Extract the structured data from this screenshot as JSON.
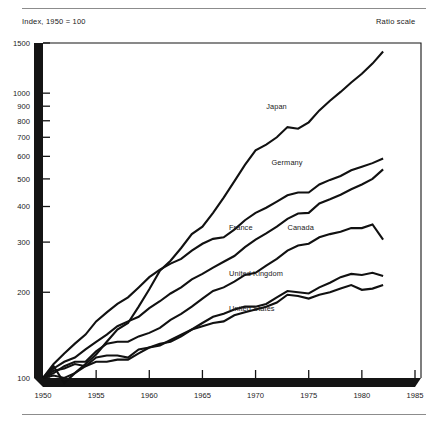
{
  "notes": {
    "index_note": "Index, 1950 = 100",
    "ratio_note": "Ratio scale"
  },
  "chart_data": {
    "type": "line",
    "title": "",
    "subtitle": "",
    "xlabel": "",
    "ylabel": "Index, 1950 = 100",
    "scale": "log",
    "grid": false,
    "legend_position": "inline-labels",
    "xlim": [
      1950,
      1985
    ],
    "ylim": [
      90,
      1600
    ],
    "x_ticks": [
      1950,
      1955,
      1960,
      1965,
      1970,
      1975,
      1980,
      1985
    ],
    "x_tick_labels": [
      "1950",
      "1955",
      "1960",
      "1965",
      "1970",
      "1975",
      "1980",
      "1985"
    ],
    "y_ticks": [
      100,
      200,
      300,
      400,
      500,
      600,
      700,
      800,
      900,
      1000,
      1500
    ],
    "y_tick_labels": [
      "100",
      "200",
      "300",
      "400",
      "500",
      "600",
      "700",
      "800",
      "900",
      "1000",
      "1500"
    ],
    "line_color": "#111111",
    "series": [
      {
        "name": "Japan",
        "label": "Japan",
        "label_x": 1971.0,
        "label_y": 880,
        "x": [
          1950,
          1951,
          1952,
          1953,
          1954,
          1955,
          1956,
          1957,
          1958,
          1959,
          1960,
          1961,
          1962,
          1963,
          1964,
          1965,
          1966,
          1967,
          1968,
          1969,
          1970,
          1971,
          1972,
          1973,
          1974,
          1975,
          1976,
          1977,
          1978,
          1979,
          1980,
          1981,
          1982
        ],
        "y": [
          100,
          110,
          96,
          104,
          112,
          121,
          134,
          148,
          156,
          178,
          205,
          238,
          258,
          286,
          320,
          340,
          380,
          430,
          490,
          560,
          630,
          660,
          700,
          760,
          750,
          790,
          870,
          940,
          1010,
          1090,
          1170,
          1270,
          1400
        ]
      },
      {
        "name": "Germany",
        "label": "Germany",
        "label_x": 1971.5,
        "label_y": 560,
        "x": [
          1950,
          1951,
          1952,
          1953,
          1954,
          1955,
          1956,
          1957,
          1958,
          1959,
          1960,
          1961,
          1962,
          1963,
          1964,
          1965,
          1966,
          1967,
          1968,
          1969,
          1970,
          1971,
          1972,
          1973,
          1974,
          1975,
          1976,
          1977,
          1978,
          1979,
          1980,
          1981,
          1982
        ],
        "y": [
          100,
          112,
          122,
          132,
          142,
          158,
          170,
          182,
          192,
          208,
          226,
          240,
          252,
          262,
          280,
          296,
          308,
          312,
          332,
          358,
          380,
          396,
          416,
          438,
          448,
          448,
          478,
          496,
          512,
          536,
          552,
          568,
          590
        ]
      },
      {
        "name": "France",
        "label": "France",
        "label_x": 1967.5,
        "label_y": 330,
        "x": [
          1950,
          1951,
          1952,
          1953,
          1954,
          1955,
          1956,
          1957,
          1958,
          1959,
          1960,
          1961,
          1962,
          1963,
          1964,
          1965,
          1966,
          1967,
          1968,
          1969,
          1970,
          1971,
          1972,
          1973,
          1974,
          1975,
          1976,
          1977,
          1978,
          1979,
          1980,
          1981,
          1982
        ],
        "y": [
          100,
          108,
          114,
          118,
          126,
          134,
          142,
          152,
          158,
          164,
          176,
          186,
          198,
          208,
          222,
          232,
          244,
          256,
          268,
          288,
          306,
          322,
          340,
          362,
          378,
          380,
          410,
          424,
          440,
          460,
          478,
          500,
          540
        ]
      },
      {
        "name": "Canada",
        "label": "Canada",
        "label_x": 1973.0,
        "label_y": 330,
        "x": [
          1950,
          1951,
          1952,
          1953,
          1954,
          1955,
          1956,
          1957,
          1958,
          1959,
          1960,
          1961,
          1962,
          1963,
          1964,
          1965,
          1966,
          1967,
          1968,
          1969,
          1970,
          1971,
          1972,
          1973,
          1974,
          1975,
          1976,
          1977,
          1978,
          1979,
          1980,
          1981,
          1982
        ],
        "y": [
          100,
          104,
          110,
          114,
          114,
          124,
          132,
          134,
          134,
          140,
          144,
          150,
          160,
          168,
          178,
          190,
          202,
          208,
          218,
          230,
          234,
          248,
          262,
          280,
          292,
          296,
          312,
          320,
          326,
          336,
          336,
          346,
          306
        ]
      },
      {
        "name": "United Kingdom",
        "label": "United Kingdom",
        "label_x": 1967.5,
        "label_y": 228,
        "x": [
          1950,
          1951,
          1952,
          1953,
          1954,
          1955,
          1956,
          1957,
          1958,
          1959,
          1960,
          1961,
          1962,
          1963,
          1964,
          1965,
          1966,
          1967,
          1968,
          1969,
          1970,
          1971,
          1972,
          1973,
          1974,
          1975,
          1976,
          1977,
          1978,
          1979,
          1980,
          1981,
          1982
        ],
        "y": [
          100,
          102,
          100,
          104,
          110,
          114,
          114,
          116,
          116,
          122,
          128,
          132,
          134,
          140,
          148,
          152,
          156,
          158,
          166,
          170,
          174,
          178,
          184,
          196,
          194,
          190,
          196,
          200,
          206,
          212,
          204,
          206,
          212
        ]
      },
      {
        "name": "United States",
        "label": "United States",
        "label_x": 1967.5,
        "label_y": 172,
        "x": [
          1950,
          1951,
          1952,
          1953,
          1954,
          1955,
          1956,
          1957,
          1958,
          1959,
          1960,
          1961,
          1962,
          1963,
          1964,
          1965,
          1966,
          1967,
          1968,
          1969,
          1970,
          1971,
          1972,
          1973,
          1974,
          1975,
          1976,
          1977,
          1978,
          1979,
          1980,
          1981,
          1982
        ],
        "y": [
          100,
          106,
          108,
          112,
          110,
          118,
          120,
          120,
          118,
          126,
          128,
          130,
          136,
          142,
          148,
          156,
          164,
          168,
          174,
          178,
          178,
          182,
          192,
          202,
          200,
          198,
          208,
          216,
          226,
          232,
          230,
          234,
          228
        ]
      }
    ]
  }
}
